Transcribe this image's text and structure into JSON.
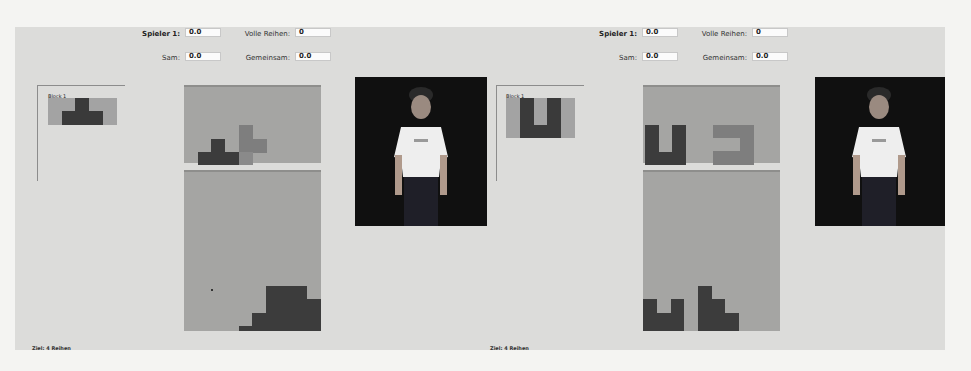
{
  "colors": {
    "background_panel": "#dcdcda",
    "board_bg": "#a5a5a3",
    "block_dark": "#3c3c3c",
    "block_mid": "#7e7e7e",
    "avatar_bg": "#101010"
  },
  "players": [
    {
      "header": {
        "spieler_label": "Spieler 1:",
        "spieler_value": "0.0",
        "volle_reihen_label": "Volle Reihen:",
        "volle_reihen_value": "0",
        "sam_label": "Sam:",
        "sam_value": "0.0",
        "gemeinsam_label": "Gemeinsam:",
        "gemeinsam_value": "0.0"
      },
      "block_preview": {
        "title": "Block 1",
        "shape": "T-piece"
      },
      "board": {
        "columns": 10,
        "rows": 12
      },
      "goal": "Ziel: 4 Reihen",
      "avatar": "3D character avatar"
    },
    {
      "header": {
        "spieler_label": "Spieler 1:",
        "spieler_value": "0.0",
        "volle_reihen_label": "Volle Reihen:",
        "volle_reihen_value": "0",
        "sam_label": "Sam:",
        "sam_value": "0.0",
        "gemeinsam_label": "Gemeinsam:",
        "gemeinsam_value": "0.0"
      },
      "block_preview": {
        "title": "Block 1",
        "shape": "U-piece"
      },
      "board": {
        "columns": 10,
        "rows": 12
      },
      "goal": "Ziel: 4 Reihen",
      "avatar": "3D character avatar"
    }
  ]
}
